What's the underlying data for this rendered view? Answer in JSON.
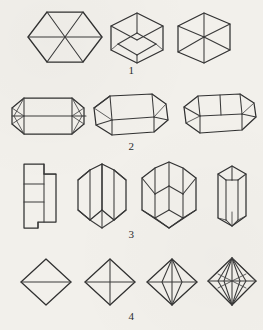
{
  "plate": {
    "background_color": "#f2f0eb",
    "line_color": "#3a3a3a",
    "title": "",
    "width": 263,
    "height": 330,
    "description": "Mineralogical crystal-form plate: four numbered rows of line-drawn crystal habits"
  },
  "rows": [
    {
      "number": "1",
      "label": "1",
      "name": "hexagonal-and-rhombohedral-forms",
      "figures": [
        {
          "name": "hexagon-with-three-diagonals",
          "view": "plan",
          "sides": 6,
          "internal_lines": 3
        },
        {
          "name": "rhombohedron-isometric-near-vertex",
          "view": "clinographic",
          "sides": 6,
          "internal_lines": 3
        },
        {
          "name": "cube-isometric-offset-vertex",
          "view": "clinographic",
          "sides": 6,
          "internal_lines": 3
        }
      ]
    },
    {
      "number": "2",
      "label": "2",
      "name": "elongated-prismatic-forms",
      "figures": [
        {
          "name": "hexagonal-prism-flat-elevation",
          "view": "elevation",
          "internal_lines": 4
        },
        {
          "name": "hexagonal-prism-tilted",
          "view": "clinographic",
          "internal_lines": 6
        },
        {
          "name": "hexagonal-prism-steeply-tilted",
          "view": "clinographic",
          "internal_lines": 6
        }
      ]
    },
    {
      "number": "3",
      "label": "3",
      "name": "twinned-v-shaped-prisms",
      "figures": [
        {
          "name": "orthographic-projection-rectangles",
          "view": "orthographic",
          "internal_lines": 4
        },
        {
          "name": "v-twin-prism-oblique",
          "view": "clinographic",
          "internal_lines": 6
        },
        {
          "name": "v-twin-prism-frontal",
          "view": "clinographic",
          "internal_lines": 7
        },
        {
          "name": "v-twin-prism-edge-on",
          "view": "clinographic",
          "internal_lines": 6
        }
      ]
    },
    {
      "number": "4",
      "label": "4",
      "name": "bipyramidal-octahedral-forms",
      "figures": [
        {
          "name": "rhombic-bipyramid-simple",
          "view": "elevation",
          "internal_lines": 1
        },
        {
          "name": "rhombic-bipyramid-cross-axes",
          "view": "elevation",
          "internal_lines": 2
        },
        {
          "name": "rhombic-bipyramid-inscribed-lens",
          "view": "clinographic",
          "internal_lines": 4
        },
        {
          "name": "rhombic-bipyramid-multiple-inscribed",
          "view": "clinographic",
          "internal_lines": 7
        }
      ]
    }
  ]
}
